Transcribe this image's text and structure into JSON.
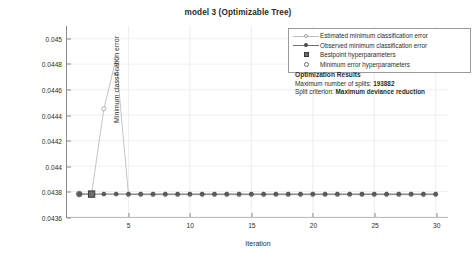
{
  "chart_data": {
    "type": "line",
    "title": "model 3 (Optimizable Tree)",
    "xlabel": "Iteration",
    "ylabel": "Minimum classification error",
    "xlim": [
      0,
      31
    ],
    "ylim": [
      0.0436,
      0.0451
    ],
    "xticks": [
      5,
      10,
      15,
      20,
      25,
      30
    ],
    "yticks": [
      "0.0436",
      "0.0438",
      "0.044",
      "0.0442",
      "0.0444",
      "0.0446",
      "0.0448",
      "0.045"
    ],
    "ytick_values": [
      0.0436,
      0.0438,
      0.044,
      0.0442,
      0.0444,
      0.0446,
      0.0448,
      0.045
    ],
    "grid": true,
    "legend_position": "top-right",
    "x": [
      1,
      2,
      3,
      4,
      5,
      6,
      7,
      8,
      9,
      10,
      11,
      12,
      13,
      14,
      15,
      16,
      17,
      18,
      19,
      20,
      21,
      22,
      23,
      24,
      25,
      26,
      27,
      28,
      29,
      30
    ],
    "series": [
      {
        "name": "Estimated minimum classification error",
        "marker": "open-circle",
        "color": "#bdbdbd",
        "values": [
          0.04378,
          0.04378,
          0.04445,
          0.044845,
          0.043775,
          0.043775,
          0.043775,
          0.043775,
          0.043775,
          0.043775,
          0.043775,
          0.043775,
          0.043775,
          0.043775,
          0.043775,
          0.043775,
          0.043775,
          0.043775,
          0.043775,
          0.043775,
          0.043775,
          0.043775,
          0.043775,
          0.043775,
          0.043775,
          0.043775,
          0.043775,
          0.043775,
          0.043775,
          0.043775
        ]
      },
      {
        "name": "Observed minimum classification error",
        "marker": "filled-circle",
        "color": "#555555",
        "values": [
          0.04378,
          0.04378,
          0.04378,
          0.04378,
          0.04378,
          0.04378,
          0.04378,
          0.04378,
          0.04378,
          0.04378,
          0.04378,
          0.04378,
          0.04378,
          0.04378,
          0.04378,
          0.04378,
          0.04378,
          0.04378,
          0.04378,
          0.04378,
          0.04378,
          0.04378,
          0.04378,
          0.04378,
          0.04378,
          0.04378,
          0.04378,
          0.04378,
          0.04378,
          0.04378
        ]
      }
    ],
    "markers": [
      {
        "name": "Bestpoint hyperparameters",
        "marker": "filled-square",
        "x": 2,
        "y": 0.04378
      },
      {
        "name": "Minimum error hyperparameters",
        "marker": "open-circle",
        "x": 1,
        "y": 0.04378
      }
    ]
  },
  "legend": {
    "items": [
      {
        "label": "Estimated minimum classification error",
        "glyph": "line-open-circle-icon"
      },
      {
        "label": "Observed minimum classification error",
        "glyph": "line-filled-circle-icon"
      },
      {
        "label": "Bestpoint hyperparameters",
        "glyph": "filled-square-icon"
      },
      {
        "label": "Minimum error hyperparameters",
        "glyph": "open-circle-icon"
      }
    ]
  },
  "results": {
    "title": "Optimization Results",
    "lines": [
      {
        "label": "Maximum number of splits: ",
        "value": "193882"
      },
      {
        "label": "Split criterion: ",
        "value": "Maximum deviance reduction"
      }
    ]
  }
}
